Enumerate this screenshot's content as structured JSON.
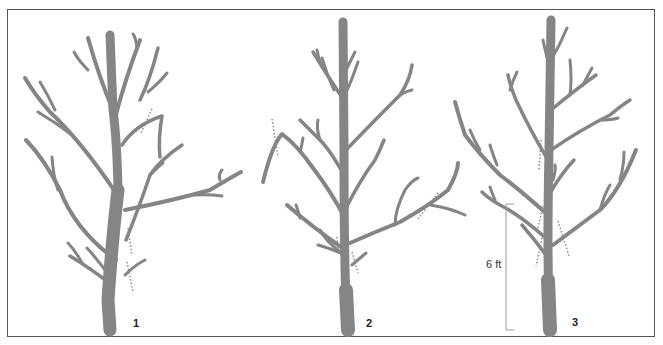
{
  "figure": {
    "colors": {
      "tree": "#858585",
      "cut": "#8a8a8a",
      "border": "#555555",
      "scale": "#999999"
    },
    "trees": [
      {
        "label": "1"
      },
      {
        "label": "2"
      },
      {
        "label": "3"
      }
    ],
    "scale_bar": {
      "label": "6 ft"
    }
  }
}
